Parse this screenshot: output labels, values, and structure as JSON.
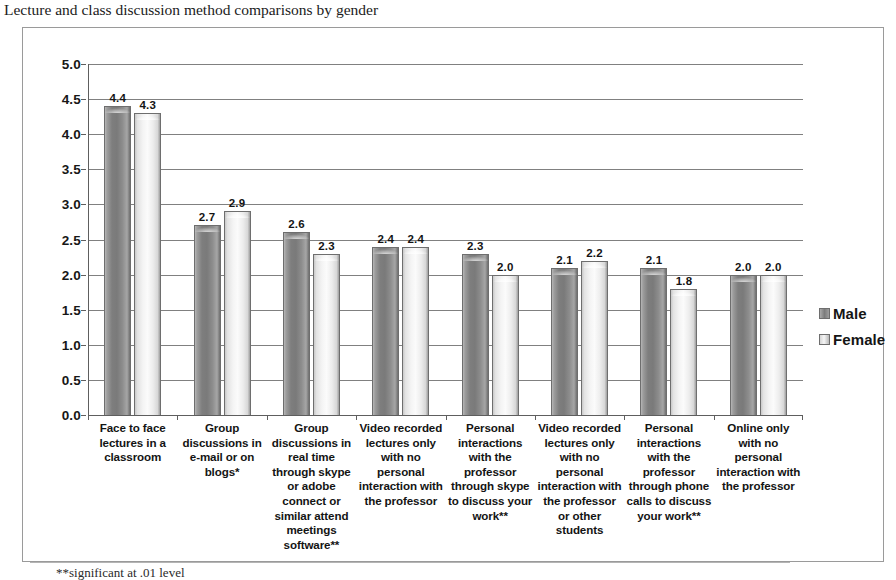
{
  "chart_data": {
    "type": "bar",
    "title": "Lecture and class discussion method comparisons by gender",
    "xlabel": "",
    "ylabel": "",
    "ylim": [
      0,
      5
    ],
    "ytick_step": 0.5,
    "yticks": [
      "5.0",
      "4.5",
      "4.0",
      "3.5",
      "3.0",
      "2.5",
      "2.0",
      "1.5",
      "1.0",
      "0.5",
      "0.0"
    ],
    "grid": true,
    "legend_position": "right",
    "categories": [
      "Face to face lectures in a classroom",
      "Group discussions in e-mail or on blogs*",
      "Group discussions in real time through skype or adobe connect or similar attend meetings software**",
      "Video recorded lectures only with no personal interaction with the professor",
      "Personal interactions with the professor through skype to discuss your work**",
      "Video recorded lectures only with no personal interaction with the professor or other students",
      "Personal interactions with the professor through phone calls to discuss your work**",
      "Online only with no personal interaction with the professor"
    ],
    "series": [
      {
        "name": "Male",
        "color": "#7e7e7e",
        "values": [
          4.4,
          2.7,
          2.6,
          2.4,
          2.3,
          2.1,
          2.1,
          2.0
        ],
        "labels": [
          "4.4",
          "2.7",
          "2.6",
          "2.4",
          "2.3",
          "2.1",
          "2.1",
          "2.0"
        ]
      },
      {
        "name": "Female",
        "color": "#f2f2f2",
        "values": [
          4.3,
          2.9,
          2.3,
          2.4,
          2.0,
          2.2,
          1.8,
          2.0
        ],
        "labels": [
          "4.3",
          "2.9",
          "2.3",
          "2.4",
          "2.0",
          "2.2",
          "1.8",
          "2.0"
        ]
      }
    ],
    "footnote": "**significant at .01 level"
  },
  "legend": {
    "items": [
      {
        "label": "Male"
      },
      {
        "label": "Female"
      }
    ]
  }
}
